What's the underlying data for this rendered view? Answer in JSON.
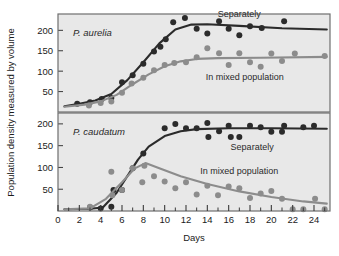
{
  "figure": {
    "background": "#ffffff",
    "plot_background": "#e8e8e8",
    "frame_color": "#6e6e6e",
    "dark_color": "#2b2b2b",
    "gray_color": "#8c8c8c"
  },
  "axes": {
    "x_title": "Days",
    "y_title": "Population density measured by volume",
    "x_ticks": [
      "0",
      "2",
      "4",
      "6",
      "8",
      "10",
      "12",
      "14",
      "16",
      "18",
      "20",
      "22",
      "24"
    ],
    "y_ticks_top": [
      "50",
      "100",
      "150",
      "200"
    ],
    "y_ticks_bottom": [
      "50",
      "100",
      "150",
      "200"
    ]
  },
  "chart_data": {
    "type": "scatter",
    "title": "",
    "xlabel": "Days",
    "ylabel": "Population density measured by volume",
    "xlim": [
      0,
      25.5
    ],
    "xticks": [
      0,
      2,
      4,
      6,
      8,
      10,
      12,
      14,
      16,
      18,
      20,
      22,
      24
    ],
    "xminor_ticks": [
      1,
      3,
      5,
      7,
      9,
      11,
      13,
      15,
      17,
      19,
      21,
      23,
      25
    ],
    "grid": false,
    "legend_position": "inline-annotations",
    "panels": [
      {
        "name": "top-panel",
        "species": "P. aurelia",
        "ylim": [
          0,
          240
        ],
        "yticks": [
          50,
          100,
          150,
          200
        ],
        "annotations": [
          {
            "text": "Separately",
            "x": 17.0,
            "y": 232
          },
          {
            "text": "In mixed population",
            "x": 17.5,
            "y": 78
          }
        ],
        "series": [
          {
            "name": "Separately",
            "color": "#2b2b2b",
            "points": [
              {
                "x": 1.8,
                "y": 20
              },
              {
                "x": 3.0,
                "y": 24
              },
              {
                "x": 4.1,
                "y": 32
              },
              {
                "x": 5.0,
                "y": 34
              },
              {
                "x": 6.0,
                "y": 73
              },
              {
                "x": 7.0,
                "y": 90
              },
              {
                "x": 8.0,
                "y": 118
              },
              {
                "x": 9.0,
                "y": 148
              },
              {
                "x": 9.6,
                "y": 160
              },
              {
                "x": 10.1,
                "y": 178
              },
              {
                "x": 10.8,
                "y": 220
              },
              {
                "x": 11.9,
                "y": 230
              },
              {
                "x": 13.0,
                "y": 204
              },
              {
                "x": 14.0,
                "y": 192
              },
              {
                "x": 15.1,
                "y": 222
              },
              {
                "x": 16.0,
                "y": 204
              },
              {
                "x": 17.0,
                "y": 188
              },
              {
                "x": 18.0,
                "y": 210
              },
              {
                "x": 19.1,
                "y": 206
              },
              {
                "x": 21.2,
                "y": 222
              }
            ],
            "fit_curve": [
              {
                "x": 0.6,
                "y": 14
              },
              {
                "x": 2.0,
                "y": 20
              },
              {
                "x": 3.5,
                "y": 28
              },
              {
                "x": 5.0,
                "y": 44
              },
              {
                "x": 6.5,
                "y": 78
              },
              {
                "x": 8.0,
                "y": 122
              },
              {
                "x": 9.5,
                "y": 168
              },
              {
                "x": 11.0,
                "y": 202
              },
              {
                "x": 12.5,
                "y": 214
              },
              {
                "x": 14.0,
                "y": 215
              },
              {
                "x": 17.0,
                "y": 211
              },
              {
                "x": 21.0,
                "y": 205
              },
              {
                "x": 25.2,
                "y": 202
              }
            ]
          },
          {
            "name": "In mixed population",
            "color": "#8c8c8c",
            "points": [
              {
                "x": 2.9,
                "y": 16
              },
              {
                "x": 4.0,
                "y": 22
              },
              {
                "x": 5.0,
                "y": 26
              },
              {
                "x": 6.0,
                "y": 47
              },
              {
                "x": 6.9,
                "y": 70
              },
              {
                "x": 8.0,
                "y": 84
              },
              {
                "x": 9.0,
                "y": 102
              },
              {
                "x": 10.0,
                "y": 115
              },
              {
                "x": 10.9,
                "y": 120
              },
              {
                "x": 12.0,
                "y": 122
              },
              {
                "x": 13.0,
                "y": 134
              },
              {
                "x": 14.0,
                "y": 156
              },
              {
                "x": 15.1,
                "y": 144
              },
              {
                "x": 16.0,
                "y": 115
              },
              {
                "x": 17.0,
                "y": 144
              },
              {
                "x": 18.0,
                "y": 122
              },
              {
                "x": 19.0,
                "y": 111
              },
              {
                "x": 20.0,
                "y": 143
              },
              {
                "x": 21.0,
                "y": 125
              },
              {
                "x": 22.2,
                "y": 143
              },
              {
                "x": 25.0,
                "y": 137
              }
            ],
            "fit_curve": [
              {
                "x": 0.6,
                "y": 13
              },
              {
                "x": 2.5,
                "y": 18
              },
              {
                "x": 4.0,
                "y": 26
              },
              {
                "x": 5.5,
                "y": 42
              },
              {
                "x": 7.0,
                "y": 68
              },
              {
                "x": 8.5,
                "y": 92
              },
              {
                "x": 10.0,
                "y": 112
              },
              {
                "x": 11.5,
                "y": 124
              },
              {
                "x": 13.0,
                "y": 130
              },
              {
                "x": 15.0,
                "y": 132
              },
              {
                "x": 19.0,
                "y": 133
              },
              {
                "x": 25.2,
                "y": 135
              }
            ]
          }
        ]
      },
      {
        "name": "bottom-panel",
        "species": "P. caudatum",
        "ylim": [
          0,
          225
        ],
        "yticks": [
          50,
          100,
          150,
          200
        ],
        "annotations": [
          {
            "text": "Separately",
            "x": 18.2,
            "y": 140
          },
          {
            "text": "In mixed population",
            "x": 17.0,
            "y": 86
          }
        ],
        "series": [
          {
            "name": "Separately",
            "color": "#2b2b2b",
            "points": [
              {
                "x": 3.0,
                "y": 8
              },
              {
                "x": 4.0,
                "y": 6
              },
              {
                "x": 5.0,
                "y": 10
              },
              {
                "x": 5.2,
                "y": 48
              },
              {
                "x": 6.0,
                "y": 48
              },
              {
                "x": 7.0,
                "y": 98
              },
              {
                "x": 8.0,
                "y": 132
              },
              {
                "x": 10.0,
                "y": 190
              },
              {
                "x": 11.0,
                "y": 200
              },
              {
                "x": 12.0,
                "y": 190
              },
              {
                "x": 13.0,
                "y": 190
              },
              {
                "x": 14.0,
                "y": 202
              },
              {
                "x": 14.1,
                "y": 170
              },
              {
                "x": 15.1,
                "y": 183
              },
              {
                "x": 16.0,
                "y": 196
              },
              {
                "x": 16.2,
                "y": 170
              },
              {
                "x": 17.0,
                "y": 170
              },
              {
                "x": 18.0,
                "y": 196
              },
              {
                "x": 19.0,
                "y": 192
              },
              {
                "x": 20.0,
                "y": 182
              },
              {
                "x": 21.0,
                "y": 182
              },
              {
                "x": 21.2,
                "y": 196
              },
              {
                "x": 23.0,
                "y": 192
              },
              {
                "x": 24.0,
                "y": 196
              }
            ],
            "fit_curve": [
              {
                "x": 0.6,
                "y": 4
              },
              {
                "x": 3.0,
                "y": 5
              },
              {
                "x": 4.2,
                "y": 8
              },
              {
                "x": 5.5,
                "y": 42
              },
              {
                "x": 6.5,
                "y": 80
              },
              {
                "x": 7.5,
                "y": 118
              },
              {
                "x": 8.5,
                "y": 148
              },
              {
                "x": 10.0,
                "y": 172
              },
              {
                "x": 11.5,
                "y": 183
              },
              {
                "x": 13.0,
                "y": 188
              },
              {
                "x": 16.0,
                "y": 190
              },
              {
                "x": 20.0,
                "y": 190
              },
              {
                "x": 25.2,
                "y": 189
              }
            ]
          },
          {
            "name": "In mixed population",
            "color": "#8c8c8c",
            "points": [
              {
                "x": 3.0,
                "y": 10
              },
              {
                "x": 5.0,
                "y": 90
              },
              {
                "x": 5.1,
                "y": 36
              },
              {
                "x": 6.0,
                "y": 48
              },
              {
                "x": 7.0,
                "y": 98
              },
              {
                "x": 7.9,
                "y": 66
              },
              {
                "x": 8.1,
                "y": 104
              },
              {
                "x": 9.0,
                "y": 80
              },
              {
                "x": 10.0,
                "y": 68
              },
              {
                "x": 11.0,
                "y": 52
              },
              {
                "x": 12.0,
                "y": 66
              },
              {
                "x": 13.0,
                "y": 38
              },
              {
                "x": 14.0,
                "y": 58
              },
              {
                "x": 15.0,
                "y": 36
              },
              {
                "x": 16.0,
                "y": 56
              },
              {
                "x": 17.0,
                "y": 52
              },
              {
                "x": 18.0,
                "y": 30
              },
              {
                "x": 19.0,
                "y": 40
              },
              {
                "x": 20.0,
                "y": 46
              },
              {
                "x": 21.0,
                "y": 28
              },
              {
                "x": 22.0,
                "y": 4
              },
              {
                "x": 23.0,
                "y": 4
              },
              {
                "x": 24.1,
                "y": 28
              },
              {
                "x": 25.0,
                "y": 4
              }
            ],
            "fit_curve": [
              {
                "x": 0.6,
                "y": 4
              },
              {
                "x": 3.0,
                "y": 6
              },
              {
                "x": 4.5,
                "y": 28
              },
              {
                "x": 6.0,
                "y": 66
              },
              {
                "x": 7.2,
                "y": 98
              },
              {
                "x": 8.2,
                "y": 110
              },
              {
                "x": 9.5,
                "y": 98
              },
              {
                "x": 11.5,
                "y": 80
              },
              {
                "x": 14.0,
                "y": 62
              },
              {
                "x": 17.0,
                "y": 45
              },
              {
                "x": 20.0,
                "y": 32
              },
              {
                "x": 23.0,
                "y": 22
              },
              {
                "x": 25.2,
                "y": 17
              }
            ]
          }
        ]
      }
    ]
  }
}
